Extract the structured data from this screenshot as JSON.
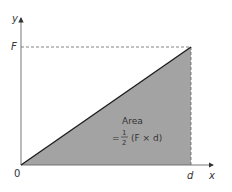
{
  "diagram": {
    "type": "force-distance graph",
    "axes": {
      "y_label": "y",
      "x_label": "x",
      "origin_label": "0",
      "y_tick_label": "F",
      "x_tick_label": "d"
    },
    "area_label": {
      "line1": "Area",
      "equals": "=",
      "frac_num": "1",
      "frac_den": "2",
      "expression": "(F × d)"
    },
    "colors": {
      "fill": "#a3a3a3",
      "line": "#1a1a1a",
      "axis": "#555555",
      "dashed": "#666666"
    }
  }
}
